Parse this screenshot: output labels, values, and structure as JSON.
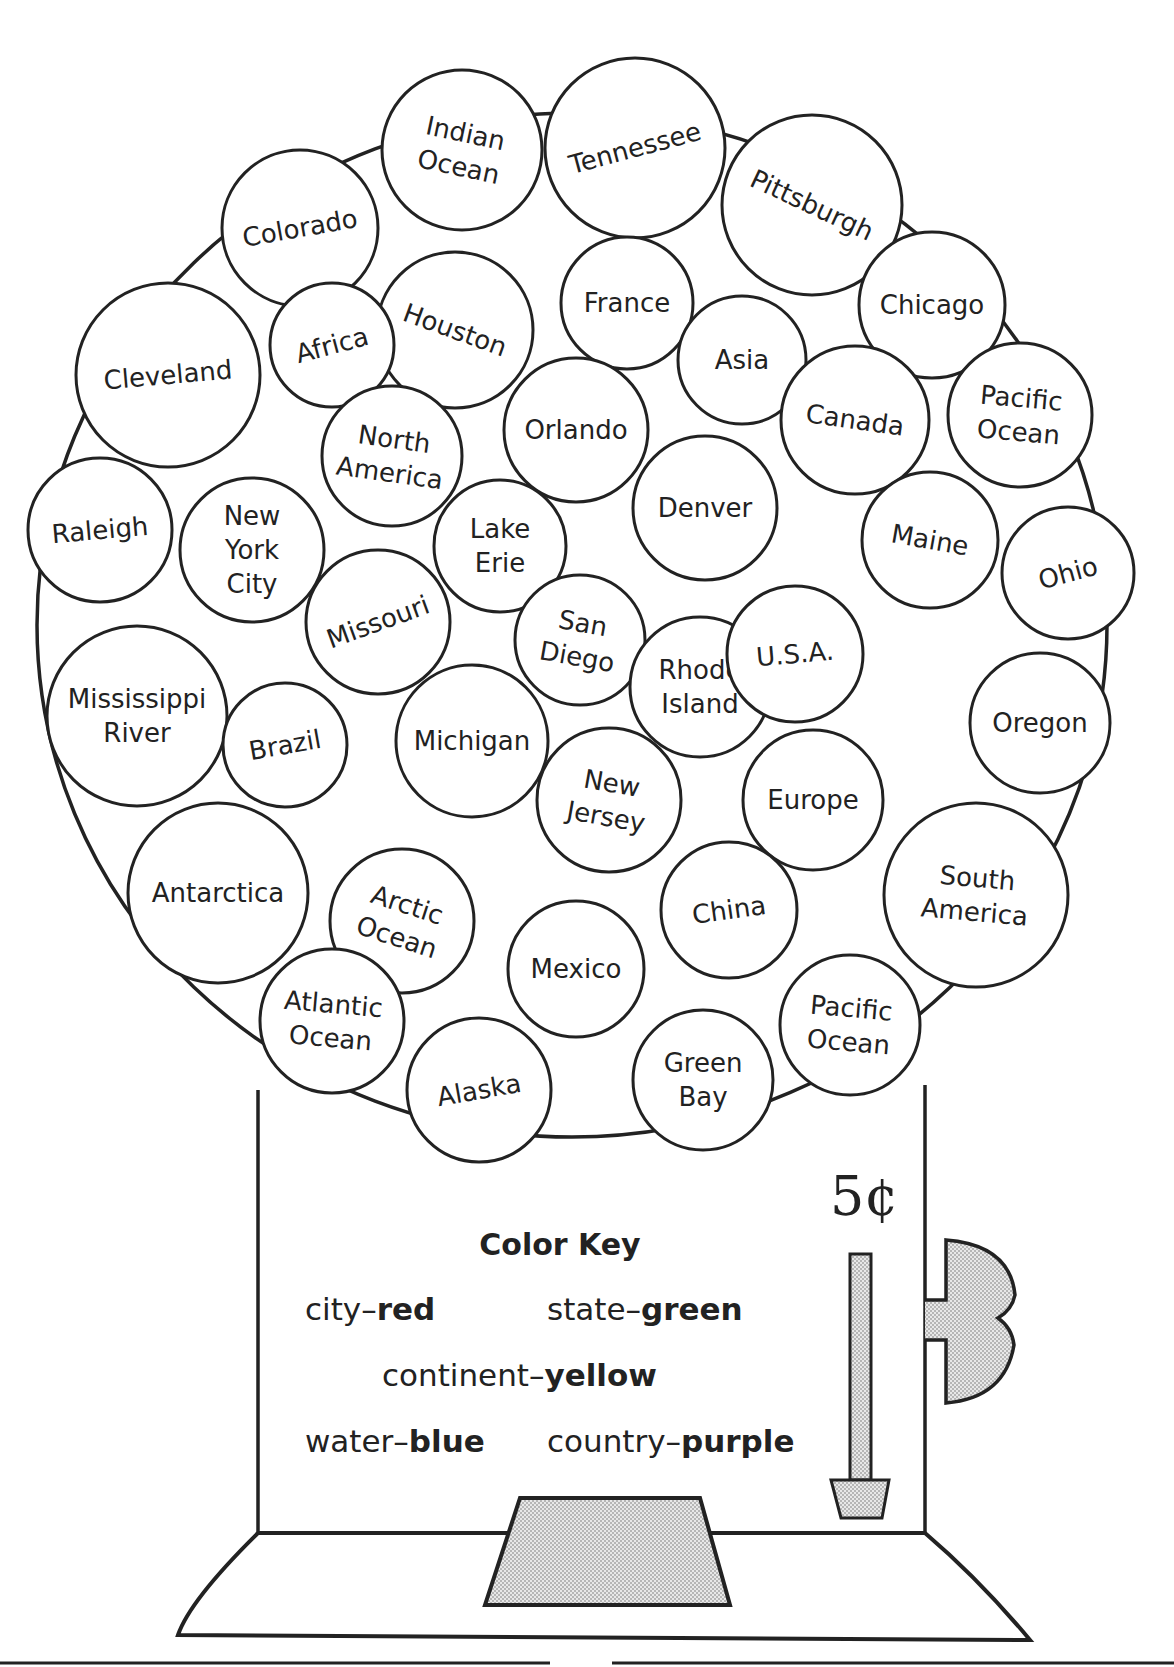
{
  "worksheet": {
    "price": "5¢",
    "color_key": {
      "title": "Color Key",
      "entries": [
        {
          "category": "city",
          "sep": "–",
          "color": "red"
        },
        {
          "category": "state",
          "sep": "–",
          "color": "green"
        },
        {
          "category": "continent",
          "sep": "–",
          "color": "yellow"
        },
        {
          "category": "water",
          "sep": "–",
          "color": "blue"
        },
        {
          "category": "country",
          "sep": "–",
          "color": "purple"
        }
      ]
    },
    "gumballs": [
      {
        "label": [
          "Indian",
          "Ocean"
        ],
        "cx": 462,
        "cy": 150,
        "r": 80,
        "rot": 12
      },
      {
        "label": [
          "Tennessee"
        ],
        "cx": 635,
        "cy": 148,
        "r": 90,
        "rot": -15
      },
      {
        "label": [
          "Pittsburgh"
        ],
        "cx": 812,
        "cy": 205,
        "r": 90,
        "rot": 25
      },
      {
        "label": [
          "Colorado"
        ],
        "cx": 300,
        "cy": 228,
        "r": 78,
        "rot": -10
      },
      {
        "label": [
          "Chicago"
        ],
        "cx": 932,
        "cy": 305,
        "r": 73,
        "rot": 0
      },
      {
        "label": [
          "France"
        ],
        "cx": 627,
        "cy": 303,
        "r": 66,
        "rot": 0
      },
      {
        "label": [
          "Houston"
        ],
        "cx": 455,
        "cy": 330,
        "r": 78,
        "rot": 20
      },
      {
        "label": [
          "Africa"
        ],
        "cx": 332,
        "cy": 345,
        "r": 62,
        "rot": -15
      },
      {
        "label": [
          "Cleveland"
        ],
        "cx": 168,
        "cy": 375,
        "r": 92,
        "rot": -5
      },
      {
        "label": [
          "Asia"
        ],
        "cx": 742,
        "cy": 360,
        "r": 64,
        "rot": 0
      },
      {
        "label": [
          "Canada"
        ],
        "cx": 855,
        "cy": 420,
        "r": 74,
        "rot": 8
      },
      {
        "label": [
          "Pacific",
          "Ocean"
        ],
        "cx": 1020,
        "cy": 415,
        "r": 72,
        "rot": 5
      },
      {
        "label": [
          "Orlando"
        ],
        "cx": 576,
        "cy": 430,
        "r": 72,
        "rot": 0
      },
      {
        "label": [
          "North",
          "America"
        ],
        "cx": 392,
        "cy": 456,
        "r": 70,
        "rot": 8
      },
      {
        "label": [
          "Raleigh"
        ],
        "cx": 100,
        "cy": 530,
        "r": 72,
        "rot": -5
      },
      {
        "label": [
          "New",
          "York",
          "City"
        ],
        "cx": 252,
        "cy": 550,
        "r": 72,
        "rot": 0
      },
      {
        "label": [
          "Lake",
          "Erie"
        ],
        "cx": 500,
        "cy": 546,
        "r": 66,
        "rot": 0
      },
      {
        "label": [
          "Denver"
        ],
        "cx": 705,
        "cy": 508,
        "r": 72,
        "rot": 0
      },
      {
        "label": [
          "Maine"
        ],
        "cx": 930,
        "cy": 540,
        "r": 68,
        "rot": 10
      },
      {
        "label": [
          "Ohio"
        ],
        "cx": 1068,
        "cy": 573,
        "r": 66,
        "rot": -15
      },
      {
        "label": [
          "Missouri"
        ],
        "cx": 378,
        "cy": 622,
        "r": 72,
        "rot": -20
      },
      {
        "label": [
          "San",
          "Diego"
        ],
        "cx": 580,
        "cy": 640,
        "r": 65,
        "rot": 10
      },
      {
        "label": [
          "Rhode",
          "Island"
        ],
        "cx": 700,
        "cy": 687,
        "r": 70,
        "rot": 0
      },
      {
        "label": [
          "U.S.A."
        ],
        "cx": 795,
        "cy": 654,
        "r": 68,
        "rot": -5
      },
      {
        "label": [
          "Mississippi",
          "River"
        ],
        "cx": 137,
        "cy": 716,
        "r": 90,
        "rot": 0
      },
      {
        "label": [
          "Brazil"
        ],
        "cx": 285,
        "cy": 745,
        "r": 62,
        "rot": -10
      },
      {
        "label": [
          "Michigan"
        ],
        "cx": 472,
        "cy": 741,
        "r": 76,
        "rot": 0
      },
      {
        "label": [
          "Oregon"
        ],
        "cx": 1040,
        "cy": 723,
        "r": 70,
        "rot": 0
      },
      {
        "label": [
          "New",
          "Jersey"
        ],
        "cx": 609,
        "cy": 800,
        "r": 72,
        "rot": 10
      },
      {
        "label": [
          "Europe"
        ],
        "cx": 813,
        "cy": 800,
        "r": 70,
        "rot": 0
      },
      {
        "label": [
          "South",
          "America"
        ],
        "cx": 976,
        "cy": 895,
        "r": 92,
        "rot": 5
      },
      {
        "label": [
          "Antarctica"
        ],
        "cx": 218,
        "cy": 893,
        "r": 90,
        "rot": 0
      },
      {
        "label": [
          "Arctic",
          "Ocean"
        ],
        "cx": 402,
        "cy": 921,
        "r": 72,
        "rot": 18
      },
      {
        "label": [
          "China"
        ],
        "cx": 729,
        "cy": 910,
        "r": 68,
        "rot": -8
      },
      {
        "label": [
          "Mexico"
        ],
        "cx": 576,
        "cy": 969,
        "r": 68,
        "rot": 0
      },
      {
        "label": [
          "Atlantic",
          "Ocean"
        ],
        "cx": 332,
        "cy": 1021,
        "r": 72,
        "rot": 5
      },
      {
        "label": [
          "Pacific",
          "Ocean"
        ],
        "cx": 850,
        "cy": 1025,
        "r": 70,
        "rot": 5
      },
      {
        "label": [
          "Alaska"
        ],
        "cx": 479,
        "cy": 1090,
        "r": 72,
        "rot": -10
      },
      {
        "label": [
          "Green",
          "Bay"
        ],
        "cx": 703,
        "cy": 1080,
        "r": 70,
        "rot": 0
      }
    ]
  }
}
